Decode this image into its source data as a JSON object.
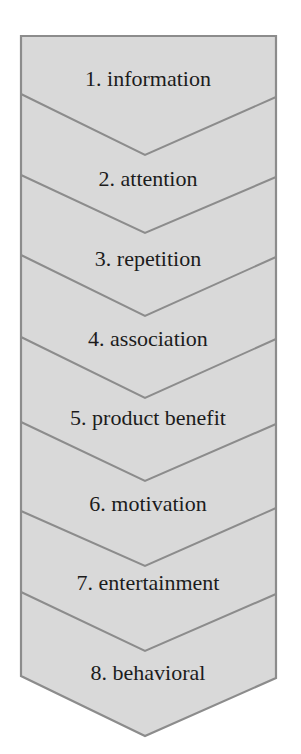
{
  "diagram": {
    "type": "chevron-process-flow",
    "orientation": "vertical",
    "colors": {
      "fill": "#d9d9d9",
      "stroke": "#8c8c8c",
      "text": "#1c1c1c",
      "background": "#ffffff"
    },
    "steps": [
      {
        "number": "1",
        "label": "1. information"
      },
      {
        "number": "2",
        "label": "2. attention"
      },
      {
        "number": "3",
        "label": "3. repetition"
      },
      {
        "number": "4",
        "label": "4. association"
      },
      {
        "number": "5",
        "label": "5. product benefit"
      },
      {
        "number": "6",
        "label": "6. motivation"
      },
      {
        "number": "7",
        "label": "7. entertainment"
      },
      {
        "number": "8",
        "label": "8. behavioral"
      }
    ]
  }
}
